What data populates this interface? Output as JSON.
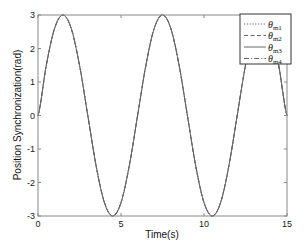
{
  "chart_data": {
    "type": "line",
    "title": "",
    "xlabel": "Time(s)",
    "ylabel": "Position Synchronization(rad)",
    "xlim": [
      0,
      15
    ],
    "ylim": [
      -3,
      3
    ],
    "xticks": [
      0,
      5,
      10,
      15
    ],
    "yticks": [
      -3,
      -2,
      -1,
      0,
      1,
      2,
      3
    ],
    "grid": false,
    "legend_position": "upper right",
    "x": [
      0,
      0.5,
      1,
      1.5,
      2,
      2.5,
      3,
      3.5,
      4,
      4.5,
      5,
      5.5,
      6,
      6.5,
      7,
      7.5,
      8,
      8.5,
      9,
      9.5,
      10,
      10.5,
      11,
      11.5,
      12,
      12.5,
      13,
      13.5,
      14,
      14.5,
      15
    ],
    "series": [
      {
        "name": "θm1",
        "label_base": "θ",
        "label_sub": "m1",
        "style": "dotted",
        "values": [
          0,
          1.5,
          2.6,
          3,
          2.6,
          1.5,
          0,
          -1.5,
          -2.6,
          -3,
          -2.6,
          -1.5,
          0,
          1.5,
          2.6,
          3,
          2.6,
          1.5,
          0,
          -1.5,
          -2.6,
          -3,
          -2.6,
          -1.5,
          0,
          1.5,
          2.6,
          3,
          2.6,
          1.5,
          0
        ]
      },
      {
        "name": "θm2",
        "label_base": "θ",
        "label_sub": "m2",
        "style": "dashed",
        "values": [
          0,
          1.5,
          2.6,
          3,
          2.6,
          1.5,
          0,
          -1.5,
          -2.6,
          -3,
          -2.6,
          -1.5,
          0,
          1.5,
          2.6,
          3,
          2.6,
          1.5,
          0,
          -1.5,
          -2.6,
          -3,
          -2.6,
          -1.5,
          0,
          1.5,
          2.6,
          3,
          2.6,
          1.5,
          0
        ]
      },
      {
        "name": "θm3",
        "label_base": "θ",
        "label_sub": "m3",
        "style": "solid",
        "values": [
          0,
          1.5,
          2.6,
          3,
          2.6,
          1.5,
          0,
          -1.5,
          -2.6,
          -3,
          -2.6,
          -1.5,
          0,
          1.5,
          2.6,
          3,
          2.6,
          1.5,
          0,
          -1.5,
          -2.6,
          -3,
          -2.6,
          -1.5,
          0,
          1.5,
          2.6,
          3,
          2.6,
          1.5,
          0
        ]
      },
      {
        "name": "θm4",
        "label_base": "θ",
        "label_sub": "m4",
        "style": "dashdot",
        "values": [
          0,
          1.5,
          2.6,
          3,
          2.6,
          1.5,
          0,
          -1.5,
          -2.6,
          -3,
          -2.6,
          -1.5,
          0,
          1.5,
          2.6,
          3,
          2.6,
          1.5,
          0,
          -1.5,
          -2.6,
          -3,
          -2.6,
          -1.5,
          0,
          1.5,
          2.6,
          3,
          2.6,
          1.5,
          0
        ]
      }
    ],
    "function_hint": "3*sin(2*pi*t/6)"
  },
  "colors": {
    "line": "#666666",
    "axis": "#888888",
    "text": "#222222",
    "background": "#ffffff"
  }
}
